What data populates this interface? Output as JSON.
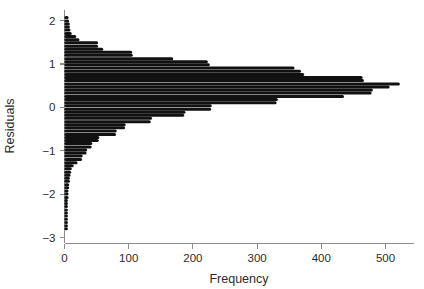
{
  "chart_data": {
    "type": "bar",
    "orientation": "horizontal",
    "title": "",
    "subtitle": "",
    "xlabel": "Frequency",
    "ylabel": "Residuals",
    "xlim": [
      0,
      535
    ],
    "ylim": [
      -3.05,
      2.15
    ],
    "grid": false,
    "legend": null,
    "xticks": [
      0,
      100,
      200,
      300,
      400,
      500
    ],
    "xticklabels": [
      "0",
      "100",
      "200",
      "300",
      "400",
      "500"
    ],
    "yticks": [
      2,
      1,
      0,
      -1,
      -2,
      -3
    ],
    "yticklabels": [
      "2",
      "1",
      "0",
      "-1",
      "-2",
      "-3"
    ],
    "bar_color": "#111111",
    "axis_color": "#8c8c8c",
    "note": "Dot-style horizontal histogram of regression residuals; each row is one residual bin, bar length = count.",
    "categories": [
      2.07,
      1.99,
      1.92,
      1.85,
      1.78,
      1.7,
      1.63,
      1.56,
      1.49,
      1.41,
      1.34,
      1.27,
      1.2,
      1.12,
      1.05,
      0.98,
      0.91,
      0.83,
      0.76,
      0.69,
      0.62,
      0.54,
      0.47,
      0.4,
      0.33,
      0.25,
      0.18,
      0.11,
      0.04,
      -0.04,
      -0.11,
      -0.18,
      -0.25,
      -0.33,
      -0.4,
      -0.47,
      -0.54,
      -0.62,
      -0.69,
      -0.76,
      -0.83,
      -0.91,
      -0.98,
      -1.05,
      -1.12,
      -1.2,
      -1.27,
      -1.34,
      -1.41,
      -1.49,
      -1.56,
      -1.63,
      -1.7,
      -1.78,
      -1.85,
      -1.92,
      -1.99,
      -2.07,
      -2.14,
      -2.21,
      -2.28,
      -2.36,
      -2.43,
      -2.5,
      -2.57,
      -2.65,
      -2.72,
      -2.79
    ],
    "values": [
      4,
      5,
      6,
      6,
      7,
      9,
      16,
      21,
      50,
      50,
      58,
      103,
      104,
      167,
      221,
      224,
      356,
      366,
      371,
      462,
      464,
      520,
      504,
      478,
      476,
      433,
      330,
      328,
      227,
      226,
      186,
      184,
      134,
      132,
      93,
      92,
      79,
      78,
      52,
      51,
      41,
      40,
      33,
      32,
      26,
      25,
      18,
      12,
      9,
      8,
      7,
      6,
      6,
      5,
      5,
      4,
      4,
      4,
      3,
      3,
      3,
      3,
      3,
      3,
      3,
      3,
      3,
      3
    ]
  },
  "axes": {
    "x_title": "Frequency",
    "y_title": "Residuals"
  }
}
